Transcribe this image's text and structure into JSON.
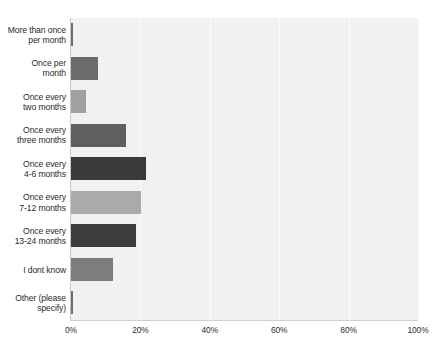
{
  "chart_data": {
    "type": "bar",
    "orientation": "horizontal",
    "title": "",
    "subtitle": "",
    "xlabel": "",
    "ylabel": "",
    "xlim": [
      0,
      100
    ],
    "grid": true,
    "legend": "none",
    "value_unit": "%",
    "tick_labels": [
      "0%",
      "20%",
      "40%",
      "60%",
      "80%",
      "100%"
    ],
    "tick_values": [
      0,
      20,
      40,
      60,
      80,
      100
    ],
    "categories": [
      "More than once per month",
      "Once per month",
      "Once every two months",
      "Once every three months",
      "Once every 4-6 months",
      "Once every 7-12 months",
      "Once every 13-24 months",
      "I dont know",
      "Other (please specify)"
    ],
    "category_label_lines": [
      [
        "More than once",
        "per month"
      ],
      [
        "Once per",
        "month"
      ],
      [
        "Once every",
        "two months"
      ],
      [
        "Once every",
        "three months"
      ],
      [
        "Once every",
        "4-6 months"
      ],
      [
        "Once every",
        "7-12 months"
      ],
      [
        "Once every",
        "13-24 months"
      ],
      [
        "I dont know"
      ],
      [
        "Other (please",
        "specify)"
      ]
    ],
    "values": [
      0.3,
      7.8,
      4.2,
      15.8,
      21.5,
      20.3,
      18.6,
      12.0,
      0.3
    ],
    "bar_colors": [
      "#6e6e6e",
      "#6b6b6b",
      "#a0a0a0",
      "#5f5f5f",
      "#3a3a3a",
      "#aaaaaa",
      "#3c3c3c",
      "#7d7d7d",
      "#6e6e6e"
    ],
    "plot_background": "#f1f1f1",
    "gridline_color": "#fbfbfb",
    "axis_color": "#c9c9c9",
    "text_color": "#2b2b2b"
  }
}
